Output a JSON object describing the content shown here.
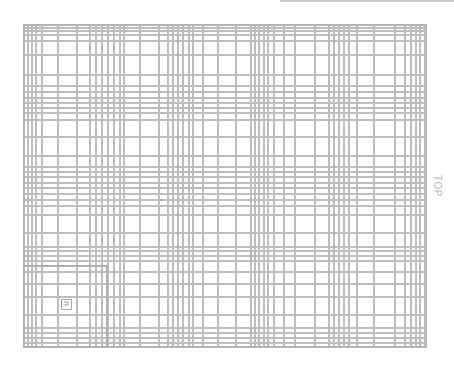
{
  "canvas": {
    "width": 454,
    "height": 367,
    "background": "#ffffff",
    "line_color": "#bdbdbd",
    "border_color": "#b4b4b4"
  },
  "grid": {
    "left": 23,
    "top": 24,
    "right": 427,
    "bottom": 348,
    "vertical_lines_x": [
      27,
      31,
      35,
      41,
      57,
      76,
      89,
      95,
      101,
      107,
      113,
      119,
      123,
      139,
      158,
      167,
      172,
      177,
      182,
      188,
      192,
      202,
      217,
      235,
      250,
      254,
      258,
      263,
      267,
      273,
      283,
      294,
      314,
      328,
      333,
      338,
      343,
      348,
      356,
      373,
      394,
      404,
      410,
      415,
      419,
      424
    ],
    "horizontal_lines_y": [
      27,
      30,
      34,
      40,
      54,
      74,
      85,
      91,
      97,
      102,
      107,
      112,
      119,
      136,
      155,
      166,
      171,
      176,
      182,
      187,
      193,
      199,
      205,
      214,
      232,
      246,
      250,
      255,
      260,
      271,
      283,
      296,
      314,
      327,
      332,
      337,
      342
    ]
  },
  "inner_box": {
    "left": 23,
    "top": 265,
    "right": 108,
    "bottom": 348
  },
  "labels": {
    "side_label": "TOP"
  },
  "icons": {
    "corner_icon": "corner-arrow-icon"
  }
}
